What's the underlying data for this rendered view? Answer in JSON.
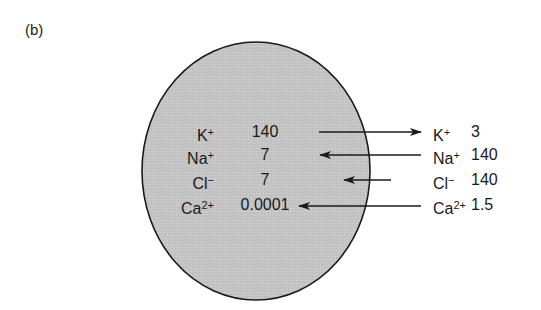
{
  "figure": {
    "panel_label": "(b)",
    "cell": {
      "fill": "#c4c4c4",
      "stroke": "#1a1a1a",
      "cx": 256,
      "cy": 171,
      "rx": 114,
      "ry": 129
    },
    "rows": [
      {
        "ion": "K",
        "charge": "+",
        "inside": "140",
        "outside": "3",
        "direction": "out"
      },
      {
        "ion": "Na",
        "charge": "+",
        "inside": "7",
        "outside": "140",
        "direction": "in"
      },
      {
        "ion": "Cl",
        "charge": "−",
        "inside": "7",
        "outside": "140",
        "direction": "in"
      },
      {
        "ion": "Ca",
        "charge": "2+",
        "inside": "0.0001",
        "outside": "1.5",
        "direction": "in"
      }
    ]
  }
}
